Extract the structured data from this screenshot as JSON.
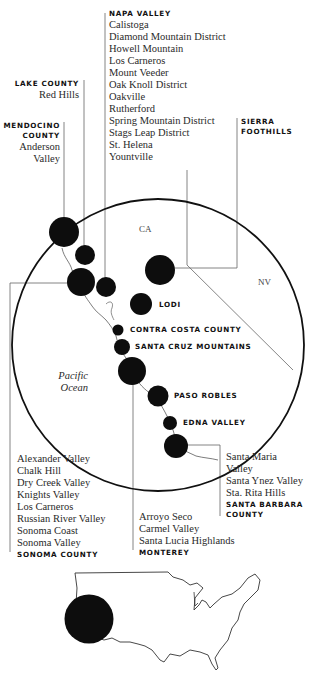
{
  "map": {
    "state_labels": {
      "ca": "CA",
      "nv": "NV"
    },
    "ocean_label": [
      "Pacific",
      "Ocean"
    ],
    "colors": {
      "dots": "#0d0d0d",
      "lines": "#555555",
      "circle": "#111111",
      "text": "#2a2a2a"
    }
  },
  "regions": {
    "napa_valley": {
      "title": "NAPA VALLEY",
      "items": [
        "Calistoga",
        "Diamond Mountain District",
        "Howell Mountain",
        "Los Carneros",
        "Mount Veeder",
        "Oak Knoll District",
        "Oakville",
        "Rutherford",
        "Spring Mountain District",
        "Stags Leap District",
        "St. Helena",
        "Yountville"
      ]
    },
    "lake_county": {
      "title": "LAKE COUNTY",
      "items": [
        "Red Hills"
      ]
    },
    "mendocino_county": {
      "title_lines": [
        "MENDOCINO",
        "COUNTY"
      ],
      "items": [
        "Anderson",
        "Valley"
      ]
    },
    "sierra_foothills": {
      "title_lines": [
        "SIERRA",
        "FOOTHILLS"
      ]
    },
    "lodi": {
      "title": "LODI"
    },
    "contra_costa": {
      "title": "CONTRA COSTA COUNTY"
    },
    "santa_cruz": {
      "title": "SANTA CRUZ MOUNTAINS"
    },
    "paso_robles": {
      "title": "PASO ROBLES"
    },
    "edna_valley": {
      "title": "EDNA VALLEY"
    },
    "sonoma_county": {
      "title": "SONOMA COUNTY",
      "items": [
        "Alexander Valley",
        "Chalk Hill",
        "Dry Creek Valley",
        "Knights Valley",
        "Los Carneros",
        "Russian River Valley",
        "Sonoma Coast",
        "Sonoma Valley"
      ]
    },
    "monterey": {
      "title": "MONTEREY",
      "items": [
        "Arroyo Seco",
        "Carmel Valley",
        "Santa Lucia Highlands"
      ]
    },
    "santa_barbara": {
      "title_lines": [
        "SANTA BARBARA",
        "COUNTY"
      ],
      "items": [
        "Santa Maria",
        "Valley",
        "Santa Ynez Valley",
        "Sta. Rita Hills"
      ]
    }
  }
}
